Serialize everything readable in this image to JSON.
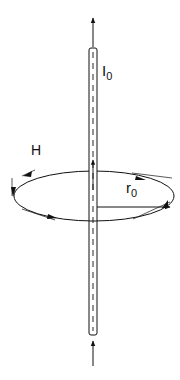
{
  "diagram": {
    "labels": {
      "current": "I",
      "current_sub": "0",
      "field": "H",
      "radius": "r",
      "radius_sub": "0"
    },
    "colors": {
      "stroke": "#111111",
      "background": "#ffffff"
    }
  }
}
